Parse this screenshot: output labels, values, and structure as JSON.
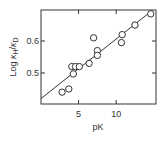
{
  "chart_data": {
    "type": "scatter",
    "title": "",
    "xlabel": "pK",
    "ylabel": "Log kH/kD",
    "xlim": [
      0,
      15.3
    ],
    "ylim": [
      0.403,
      0.697
    ],
    "xticks": [
      5,
      10
    ],
    "yticks": [
      0.5,
      0.6
    ],
    "xtick_labels": [
      "5",
      "10"
    ],
    "ytick_labels": [
      "0.5",
      "0.6"
    ],
    "grid": false,
    "legend": null,
    "marker": "open-circle",
    "points": [
      {
        "x": 2.8,
        "y": 0.44
      },
      {
        "x": 3.7,
        "y": 0.45
      },
      {
        "x": 4.1,
        "y": 0.52
      },
      {
        "x": 4.3,
        "y": 0.497
      },
      {
        "x": 4.6,
        "y": 0.52
      },
      {
        "x": 5.1,
        "y": 0.52
      },
      {
        "x": 6.4,
        "y": 0.53
      },
      {
        "x": 7.0,
        "y": 0.61
      },
      {
        "x": 7.5,
        "y": 0.57
      },
      {
        "x": 7.5,
        "y": 0.555
      },
      {
        "x": 10.8,
        "y": 0.62
      },
      {
        "x": 10.7,
        "y": 0.595
      },
      {
        "x": 12.5,
        "y": 0.65
      },
      {
        "x": 14.6,
        "y": 0.685
      }
    ],
    "fit_line": {
      "x0": 0,
      "y0": 0.42,
      "x1": 14.5,
      "y1": 0.69
    }
  },
  "axes": {
    "xlabel": "pK",
    "ylabel_prefix": "Log ",
    "ylabel_k1": "κ",
    "ylabel_sub1": "H",
    "ylabel_slash": "/",
    "ylabel_k2": "κ",
    "ylabel_sub2": "D"
  }
}
